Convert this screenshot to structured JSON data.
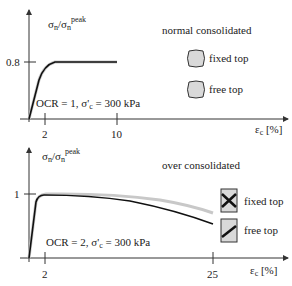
{
  "top_chart": {
    "ylabel_main": "σ",
    "ylabel_sub1": "n",
    "ylabel_sep": "/σ",
    "ylabel_sub2": "n",
    "ylabel_sup": "peak",
    "ytick": "0.8",
    "xticks": [
      "2",
      "10"
    ],
    "xlabel_main": "ε",
    "xlabel_sub": "c",
    "xlabel_unit": " [%]",
    "condition": "OCR = 1,  σ'",
    "condition_sub": "c",
    "condition_tail": " = 300 kPa",
    "title": "normal consolidated",
    "legend": [
      {
        "label": "fixed top",
        "icon": "barrel-specimen-icon"
      },
      {
        "label": "free top",
        "icon": "barrel-specimen-icon"
      }
    ]
  },
  "bottom_chart": {
    "ylabel_main": "σ",
    "ylabel_sub1": "n",
    "ylabel_sep": "/σ",
    "ylabel_sub2": "n",
    "ylabel_sup": "peak",
    "ytick": "1",
    "xticks": [
      "2",
      "25"
    ],
    "xlabel_main": "ε",
    "xlabel_sub": "c",
    "xlabel_unit": " [%]",
    "condition": "OCR = 2,  σ'",
    "condition_sub": "c",
    "condition_tail": " = 300 kPa",
    "title": "over consolidated",
    "legend": [
      {
        "label": "fixed top",
        "icon": "x-shear-band-specimen-icon"
      },
      {
        "label": "free top",
        "icon": "single-shear-band-specimen-icon"
      }
    ]
  },
  "colors": {
    "curve_fixed": "#c8c8c8",
    "curve_free": "#111111",
    "specimen_fill": "#d9d9d9",
    "axis": "#333333"
  }
}
